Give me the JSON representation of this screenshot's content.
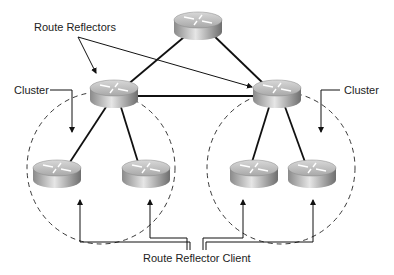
{
  "diagram": {
    "labels": {
      "route_reflectors": "Route Reflectors",
      "cluster_left": "Cluster",
      "cluster_right": "Cluster",
      "route_reflector_client": "Route Reflector Client"
    },
    "nodes": [
      {
        "id": "top",
        "role": "ibgp-peer",
        "x": 198,
        "y": 20
      },
      {
        "id": "rr-left",
        "role": "route-reflector",
        "x": 114,
        "y": 88
      },
      {
        "id": "rr-right",
        "role": "route-reflector",
        "x": 277,
        "y": 88
      },
      {
        "id": "client-1",
        "role": "route-reflector-client",
        "x": 57,
        "y": 168
      },
      {
        "id": "client-2",
        "role": "route-reflector-client",
        "x": 146,
        "y": 168
      },
      {
        "id": "client-3",
        "role": "route-reflector-client",
        "x": 254,
        "y": 168
      },
      {
        "id": "client-4",
        "role": "route-reflector-client",
        "x": 312,
        "y": 168
      }
    ],
    "links": [
      [
        "top",
        "rr-left"
      ],
      [
        "top",
        "rr-right"
      ],
      [
        "rr-left",
        "rr-right"
      ],
      [
        "rr-left",
        "client-1"
      ],
      [
        "rr-left",
        "client-2"
      ],
      [
        "rr-right",
        "client-3"
      ],
      [
        "rr-right",
        "client-4"
      ]
    ],
    "colors": {
      "line": "#111111",
      "router_top": "#c8c8c8",
      "router_side": "#9a9a9a",
      "text": "#222222"
    }
  }
}
